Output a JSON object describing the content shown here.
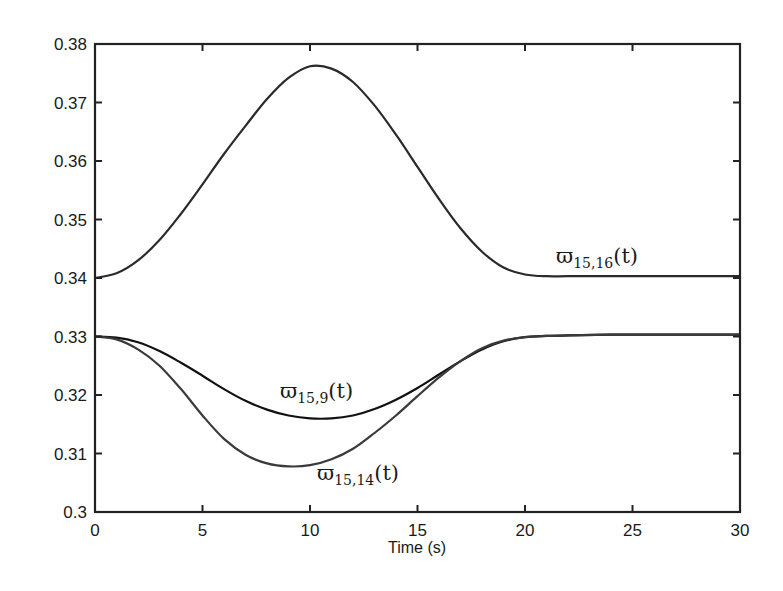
{
  "chart_data": {
    "type": "line",
    "title": "",
    "xlabel": "Time (s)",
    "ylabel": "",
    "xlim": [
      0,
      30
    ],
    "ylim": [
      0.3,
      0.38
    ],
    "grid": false,
    "legend": "none (inline curve labels)",
    "x_ticks": [
      "0",
      "5",
      "10",
      "15",
      "20",
      "25",
      "30"
    ],
    "y_ticks": [
      "0.3",
      "0.31",
      "0.32",
      "0.33",
      "0.34",
      "0.35",
      "0.36",
      "0.37",
      "0.38"
    ],
    "x": [
      0,
      1,
      2,
      3,
      4,
      5,
      6,
      7,
      8,
      9,
      10,
      11,
      12,
      13,
      14,
      15,
      16,
      17,
      18,
      19,
      20,
      21,
      22,
      24,
      26,
      28,
      30
    ],
    "series": [
      {
        "name": "ϖ15,16(t)",
        "values": [
          0.34,
          0.3408,
          0.343,
          0.3465,
          0.351,
          0.356,
          0.3612,
          0.366,
          0.3706,
          0.3742,
          0.3762,
          0.3758,
          0.3735,
          0.3695,
          0.3645,
          0.359,
          0.3535,
          0.3485,
          0.3445,
          0.3418,
          0.3406,
          0.3403,
          0.3403,
          0.3403,
          0.3403,
          0.3403,
          0.3403
        ]
      },
      {
        "name": "ϖ15,9(t)",
        "values": [
          0.33,
          0.3298,
          0.329,
          0.3275,
          0.3255,
          0.3233,
          0.321,
          0.319,
          0.3175,
          0.3165,
          0.316,
          0.316,
          0.3165,
          0.3176,
          0.3192,
          0.3212,
          0.3235,
          0.3258,
          0.3278,
          0.3292,
          0.3299,
          0.3301,
          0.3302,
          0.3303,
          0.3303,
          0.3303,
          0.3303
        ]
      },
      {
        "name": "ϖ15,14(t)",
        "values": [
          0.33,
          0.3295,
          0.3278,
          0.325,
          0.321,
          0.3165,
          0.3125,
          0.3098,
          0.3083,
          0.3078,
          0.308,
          0.309,
          0.3108,
          0.3135,
          0.3165,
          0.3198,
          0.323,
          0.3258,
          0.328,
          0.3293,
          0.3299,
          0.3301,
          0.3302,
          0.3303,
          0.3303,
          0.3303,
          0.3303
        ]
      }
    ],
    "annotations": [
      {
        "text": "ϖ15,16(t)",
        "x": 21.8,
        "y": 0.3412
      },
      {
        "text": "ϖ15,9(t)",
        "x": 8.6,
        "y": 0.3185
      },
      {
        "text": "ϖ15,14(t)",
        "x": 10.3,
        "y": 0.3058
      }
    ]
  },
  "labels": {
    "xlabel": "Time (s)",
    "x_ticks": [
      "0",
      "5",
      "10",
      "15",
      "20",
      "25",
      "30"
    ],
    "y_ticks": [
      "0.3",
      "0.31",
      "0.32",
      "0.33",
      "0.34",
      "0.35",
      "0.36",
      "0.37",
      "0.38"
    ],
    "curve_16": {
      "main": "ϖ",
      "sub": "15,16",
      "arg": "(t)"
    },
    "curve_9": {
      "main": "ϖ",
      "sub": "15,9",
      "arg": "(t)"
    },
    "curve_14": {
      "main": "ϖ",
      "sub": "15,14",
      "arg": "(t)"
    }
  }
}
